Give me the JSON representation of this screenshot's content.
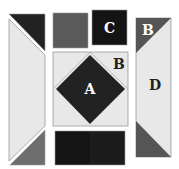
{
  "diagram": {
    "labels": {
      "a": "A",
      "b_center": "B",
      "b_right": "B",
      "c": "C",
      "d": "D"
    },
    "colors": {
      "background": "#ffffff",
      "light": "#e8e8e8",
      "dark": "#222222",
      "black": "#141414",
      "gray": "#5a5a5a",
      "mid_gray": "#6e6e6e",
      "outline": "#9a9a9a",
      "label_light": "#ffffff",
      "label_dark": "#222222"
    },
    "pieces": [
      {
        "name": "left-top-dark-triangle"
      },
      {
        "name": "left-light-parallelogram"
      },
      {
        "name": "left-bottom-gray-triangle"
      },
      {
        "name": "top-gray-square"
      },
      {
        "name": "top-black-square-c"
      },
      {
        "name": "center-light-square"
      },
      {
        "name": "center-black-diamond-a"
      },
      {
        "name": "right-top-dark-triangle-b"
      },
      {
        "name": "right-light-parallelogram-d"
      },
      {
        "name": "right-bottom-gray-triangle"
      },
      {
        "name": "bottom-black-rect-left"
      },
      {
        "name": "bottom-black-rect-right"
      }
    ]
  }
}
